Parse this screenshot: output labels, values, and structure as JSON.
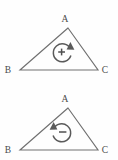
{
  "figure": {
    "stroke_color": "#707070",
    "glyph_color": "#5a5a5a",
    "background_color": "#fefefe",
    "panels": [
      {
        "id": "top",
        "name": "positive-orientation-triangle",
        "vertices": [
          {
            "key": "A",
            "label": "A",
            "x": 68,
            "y": 28,
            "label_x": 65,
            "label_y": 22
          },
          {
            "key": "B",
            "label": "B",
            "x": 20,
            "y": 70,
            "label_x": 8,
            "label_y": 73
          },
          {
            "key": "C",
            "label": "C",
            "x": 98,
            "y": 70,
            "label_x": 103,
            "label_y": 73
          }
        ],
        "rotation": {
          "sign": "+",
          "sign_name": "plus",
          "direction": "counterclockwise",
          "center_x": 62,
          "center_y": 52,
          "radius": 9
        }
      },
      {
        "id": "bottom",
        "name": "negative-orientation-triangle",
        "vertices": [
          {
            "key": "A",
            "label": "A",
            "x": 68,
            "y": 28,
            "label_x": 65,
            "label_y": 22
          },
          {
            "key": "B",
            "label": "B",
            "x": 20,
            "y": 70,
            "label_x": 8,
            "label_y": 73
          },
          {
            "key": "C",
            "label": "C",
            "x": 98,
            "y": 70,
            "label_x": 103,
            "label_y": 73
          }
        ],
        "rotation": {
          "sign": "−",
          "sign_name": "minus",
          "direction": "clockwise",
          "center_x": 62,
          "center_y": 52,
          "radius": 9
        }
      }
    ]
  }
}
